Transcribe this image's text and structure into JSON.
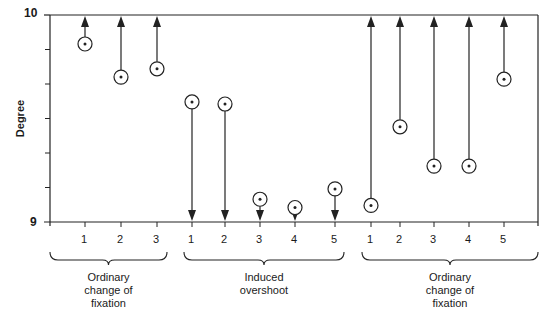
{
  "chart_data": {
    "type": "scatter",
    "title": "",
    "ylabel": "Degree",
    "xlabel": "",
    "ylim": [
      9,
      10
    ],
    "ytick_labels": [
      "9",
      "10"
    ],
    "grid": false,
    "groups": [
      {
        "name": "Ordinary change of fixation",
        "label_lines": [
          "Ordinary",
          "change of",
          "fixation"
        ],
        "categories": [
          "1",
          "2",
          "3"
        ],
        "values": [
          9.86,
          9.7,
          9.74
        ],
        "arrow_direction": "up"
      },
      {
        "name": "Induced overshoot",
        "label_lines": [
          "Induced",
          "overshoot"
        ],
        "categories": [
          "1",
          "2",
          "3",
          "4",
          "5"
        ],
        "values": [
          9.58,
          9.57,
          9.11,
          9.07,
          9.16
        ],
        "arrow_direction": "down"
      },
      {
        "name": "Ordinary change of fixation",
        "label_lines": [
          "Ordinary",
          "change of",
          "fixation"
        ],
        "categories": [
          "1",
          "2",
          "3",
          "4",
          "5"
        ],
        "values": [
          9.08,
          9.46,
          9.27,
          9.27,
          9.69
        ],
        "arrow_direction": "up"
      }
    ]
  }
}
